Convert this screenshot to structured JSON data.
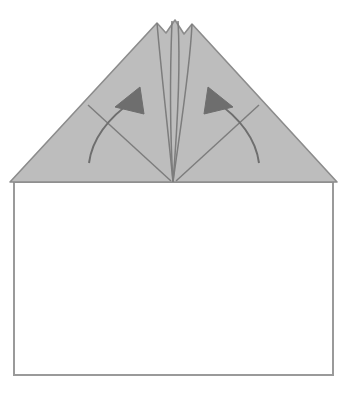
{
  "page": {
    "width": 347,
    "height": 394,
    "background_color": "#ffffff"
  },
  "caption": {
    "clipped_text_fragment": "folding"
  },
  "colors": {
    "paper_fill": "#bdbdbd",
    "paper_stroke": "#8c8c8c",
    "base_fill": "#ffffff",
    "base_stroke": "#9a9a9a",
    "crease_line": "#7d7d7d",
    "arrow_color": "#6e6e6e"
  },
  "figure": {
    "base_sheet": {
      "label": "paper-base-rectangle",
      "x": 14,
      "y": 182,
      "width": 319,
      "height": 193,
      "stroke_width": 2
    },
    "folded_flap": {
      "label": "folded-triangular-flap",
      "apex_peaks": [
        {
          "name": "left-peak",
          "x": 157,
          "y": 23
        },
        {
          "name": "center-peak",
          "x": 175,
          "y": 20
        },
        {
          "name": "right-peak",
          "x": 192,
          "y": 24
        }
      ],
      "notches": [
        {
          "name": "left-notch",
          "x": 166,
          "y": 33
        },
        {
          "name": "right-notch",
          "x": 184,
          "y": 34
        }
      ],
      "base_left": {
        "x": 10,
        "y": 182
      },
      "base_right": {
        "x": 337,
        "y": 182
      },
      "convergence_point": {
        "x": 173,
        "y": 182
      }
    },
    "creases": [
      {
        "name": "inner-crease-left",
        "from_peak": "left-peak"
      },
      {
        "name": "inner-crease-center-left",
        "from_peak": "center-peak"
      },
      {
        "name": "inner-crease-center-right",
        "from_peak": "center-peak"
      },
      {
        "name": "inner-crease-right",
        "from_peak": "right-peak"
      },
      {
        "name": "diagonal-crease-left",
        "from_edge_x": 88,
        "from_edge_y": 105
      },
      {
        "name": "diagonal-crease-right",
        "from_edge_x": 259,
        "from_edge_y": 105
      }
    ],
    "arrows": [
      {
        "name": "left-fold-arrow",
        "direction": "up-and-right",
        "tail": {
          "x": 89,
          "y": 163
        },
        "head": {
          "x": 136,
          "y": 92
        }
      },
      {
        "name": "right-fold-arrow",
        "direction": "up-and-left",
        "tail": {
          "x": 259,
          "y": 163
        },
        "head": {
          "x": 211,
          "y": 92
        }
      }
    ]
  }
}
